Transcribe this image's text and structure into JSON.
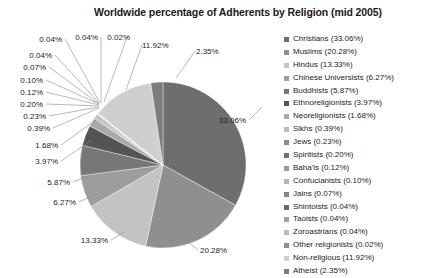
{
  "chart_data": {
    "type": "pie",
    "title": "Worldwide percentage of Adherents by Religion (mid 2005)",
    "xlabel": "",
    "ylabel": "",
    "legend_position": "right",
    "grid": false,
    "value_unit": "%",
    "categories": [
      "Christians",
      "Muslims",
      "Hindus",
      "Chinese Universists",
      "Buddhists",
      "Ethnoreligionists",
      "Neoreligionists",
      "Sikhs",
      "Jews",
      "Spiritists",
      "Baha'is",
      "Confucianists",
      "Jains",
      "Shintoists",
      "Taoists",
      "Zoroastrians",
      "Other religionists",
      "Non-religious",
      "Atheist"
    ],
    "values": [
      33.06,
      20.28,
      13.33,
      6.27,
      5.87,
      3.97,
      1.68,
      0.39,
      0.23,
      0.2,
      0.12,
      0.1,
      0.07,
      0.04,
      0.04,
      0.04,
      0.02,
      11.92,
      2.35
    ],
    "slice_colors": [
      "#6e6e6e",
      "#8f8f8f",
      "#c3c3c3",
      "#9d9d9d",
      "#777777",
      "#545454",
      "#a8a8a8",
      "#bdbdbd",
      "#8a8a8a",
      "#707070",
      "#9a9a9a",
      "#b5b5b5",
      "#868686",
      "#6a6a6a",
      "#a0a0a0",
      "#bbbbbb",
      "#909090",
      "#cfcfcf",
      "#7d7d7d"
    ]
  },
  "legend": {
    "items": [
      {
        "label": "Christians (33.06%)",
        "color": "#6e6e6e"
      },
      {
        "label": "Muslims (20.28%)",
        "color": "#8f8f8f"
      },
      {
        "label": "Hindus (13.33%)",
        "color": "#c3c3c3"
      },
      {
        "label": "Chinese Universists (6.27%)",
        "color": "#9d9d9d"
      },
      {
        "label": "Buddhists (5.87%)",
        "color": "#777777"
      },
      {
        "label": "Ethnoreligionists (3.97%)",
        "color": "#545454"
      },
      {
        "label": "Neoreligionists (1.68%)",
        "color": "#a8a8a8"
      },
      {
        "label": "Sikhs (0.39%)",
        "color": "#bdbdbd"
      },
      {
        "label": "Jews (0.23%)",
        "color": "#8a8a8a"
      },
      {
        "label": "Spiritists (0.20%)",
        "color": "#707070"
      },
      {
        "label": "Baha'is (0.12%)",
        "color": "#9a9a9a"
      },
      {
        "label": "Confucianists (0.10%)",
        "color": "#b5b5b5"
      },
      {
        "label": "Jains (0.07%)",
        "color": "#868686"
      },
      {
        "label": "Shintoists (0.04%)",
        "color": "#6a6a6a"
      },
      {
        "label": "Taoists (0.04%)",
        "color": "#a0a0a0"
      },
      {
        "label": "Zoroastrians (0.04%)",
        "color": "#bbbbbb"
      },
      {
        "label": "Other religionists (0.02%)",
        "color": "#909090"
      },
      {
        "label": "Non-religious (11.92%)",
        "color": "#cfcfcf"
      },
      {
        "label": "Atheist (2.35%)",
        "color": "#7d7d7d"
      }
    ]
  },
  "callouts": [
    {
      "text": "33.06%",
      "tx": 246,
      "ty": 123,
      "anchor": "end",
      "lx1": 249,
      "ly1": 120,
      "lx2": 262,
      "ly2": 107
    },
    {
      "text": "20.28%",
      "tx": 200,
      "ty": 253,
      "anchor": "start",
      "lx1": 198,
      "ly1": 250,
      "lx2": 186,
      "ly2": 240
    },
    {
      "text": "13.33%",
      "tx": 108,
      "ty": 243,
      "anchor": "end",
      "lx1": 111,
      "ly1": 240,
      "lx2": 124,
      "ly2": 232
    },
    {
      "text": "6.27%",
      "tx": 76,
      "ty": 205,
      "anchor": "end",
      "lx1": 79,
      "ly1": 202,
      "lx2": 92,
      "ly2": 196
    },
    {
      "text": "5.87%",
      "tx": 70,
      "ty": 185,
      "anchor": "end",
      "lx1": 73,
      "ly1": 182,
      "lx2": 88,
      "ly2": 176
    },
    {
      "text": "3.97%",
      "tx": 58,
      "ty": 164,
      "anchor": "end",
      "lx1": 61,
      "ly1": 161,
      "lx2": 92,
      "ly2": 140
    },
    {
      "text": "1.68%",
      "tx": 58,
      "ty": 148,
      "anchor": "end",
      "lx1": 61,
      "ly1": 145,
      "lx2": 96,
      "ly2": 120
    },
    {
      "text": "0.39%",
      "tx": 50,
      "ty": 131,
      "anchor": "end",
      "lx1": 53,
      "ly1": 128,
      "lx2": 99,
      "ly2": 108
    },
    {
      "text": "0.23%",
      "tx": 46,
      "ty": 119,
      "anchor": "end",
      "lx1": 49,
      "ly1": 116,
      "lx2": 99,
      "ly2": 107
    },
    {
      "text": "0.20%",
      "tx": 43,
      "ty": 107,
      "anchor": "end",
      "lx1": 46,
      "ly1": 104,
      "lx2": 99,
      "ly2": 106
    },
    {
      "text": "0.12%",
      "tx": 43,
      "ty": 95,
      "anchor": "end",
      "lx1": 46,
      "ly1": 92,
      "lx2": 99,
      "ly2": 105
    },
    {
      "text": "0.10%",
      "tx": 43,
      "ty": 83,
      "anchor": "end",
      "lx1": 46,
      "ly1": 80,
      "lx2": 99,
      "ly2": 104
    },
    {
      "text": "0.07%",
      "tx": 46,
      "ty": 70,
      "anchor": "end",
      "lx1": 49,
      "ly1": 67,
      "lx2": 99,
      "ly2": 104
    },
    {
      "text": "0.04%",
      "tx": 52,
      "ty": 58,
      "anchor": "end",
      "lx1": 55,
      "ly1": 55,
      "lx2": 99,
      "ly2": 103
    },
    {
      "text": "0.04%",
      "tx": 62,
      "ty": 42,
      "anchor": "end",
      "lx1": 65,
      "ly1": 39,
      "lx2": 100,
      "ly2": 103
    },
    {
      "text": "0.04%",
      "tx": 98,
      "ty": 40,
      "anchor": "end",
      "lx1": 101,
      "ly1": 37,
      "lx2": 101,
      "ly2": 103
    },
    {
      "text": "0.02%",
      "tx": 130,
      "ty": 40,
      "anchor": "end",
      "lx1": 127,
      "ly1": 37,
      "lx2": 104,
      "ly2": 102
    },
    {
      "text": "11.92%",
      "tx": 142,
      "ty": 48,
      "anchor": "start",
      "lx1": 142,
      "ly1": 45,
      "lx2": 126,
      "ly2": 90
    },
    {
      "text": "2.35%",
      "tx": 196,
      "ty": 54,
      "anchor": "start",
      "lx1": 195,
      "ly1": 51,
      "lx2": 176,
      "ly2": 78
    }
  ],
  "geometry": {
    "cx": 163,
    "cy": 165,
    "r": 83,
    "start_angle_deg": -90
  }
}
